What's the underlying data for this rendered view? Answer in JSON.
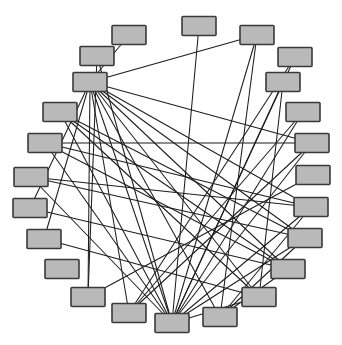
{
  "figure": {
    "type": "node-link-graph",
    "layout": "circular",
    "title": "",
    "caption": "",
    "background_color": "#ffffff"
  },
  "style": {
    "node_fill": "#b9b9b9",
    "node_stroke": "#3a3a3a",
    "node_stroke_width": 1.6,
    "edge_stroke": "#1d1d1d",
    "edge_stroke_width": 1.05,
    "node_width": 34,
    "node_height": 19,
    "node_corner_radius": 1
  },
  "chart_data": {
    "type": "diagram",
    "subtype": "circular-node-link-graph",
    "title": "",
    "xlabel": "",
    "ylabel": "",
    "grid": false,
    "legend": false,
    "node_count": 24,
    "edge_count": 46,
    "nodes": [
      {
        "id": 0,
        "label": "",
        "cx": 199,
        "cy": 26
      },
      {
        "id": 1,
        "label": "",
        "cx": 257,
        "cy": 35
      },
      {
        "id": 2,
        "label": "",
        "cx": 295,
        "cy": 57
      },
      {
        "id": 3,
        "label": "",
        "cx": 283,
        "cy": 82
      },
      {
        "id": 4,
        "label": "",
        "cx": 303,
        "cy": 112
      },
      {
        "id": 5,
        "label": "",
        "cx": 312,
        "cy": 143
      },
      {
        "id": 6,
        "label": "",
        "cx": 313,
        "cy": 175
      },
      {
        "id": 7,
        "label": "",
        "cx": 311,
        "cy": 207
      },
      {
        "id": 8,
        "label": "",
        "cx": 305,
        "cy": 238
      },
      {
        "id": 9,
        "label": "",
        "cx": 288,
        "cy": 269
      },
      {
        "id": 10,
        "label": "",
        "cx": 259,
        "cy": 297
      },
      {
        "id": 11,
        "label": "",
        "cx": 220,
        "cy": 317
      },
      {
        "id": 12,
        "label": "",
        "cx": 172,
        "cy": 323
      },
      {
        "id": 13,
        "label": "",
        "cx": 129,
        "cy": 313
      },
      {
        "id": 14,
        "label": "",
        "cx": 88,
        "cy": 297
      },
      {
        "id": 15,
        "label": "",
        "cx": 62,
        "cy": 269
      },
      {
        "id": 16,
        "label": "",
        "cx": 44,
        "cy": 239
      },
      {
        "id": 17,
        "label": "",
        "cx": 30,
        "cy": 208
      },
      {
        "id": 18,
        "label": "",
        "cx": 31,
        "cy": 177
      },
      {
        "id": 19,
        "label": "",
        "cx": 45,
        "cy": 143
      },
      {
        "id": 20,
        "label": "",
        "cx": 60,
        "cy": 112
      },
      {
        "id": 21,
        "label": "",
        "cx": 90,
        "cy": 82
      },
      {
        "id": 22,
        "label": "",
        "cx": 97,
        "cy": 56
      },
      {
        "id": 23,
        "label": "",
        "cx": 129,
        "cy": 35
      }
    ],
    "edges": [
      {
        "source": 21,
        "target": 1
      },
      {
        "source": 21,
        "target": 23
      },
      {
        "source": 21,
        "target": 12
      },
      {
        "source": 21,
        "target": 13
      },
      {
        "source": 21,
        "target": 14
      },
      {
        "source": 21,
        "target": 11
      },
      {
        "source": 21,
        "target": 10
      },
      {
        "source": 21,
        "target": 9
      },
      {
        "source": 21,
        "target": 8
      },
      {
        "source": 21,
        "target": 7
      },
      {
        "source": 21,
        "target": 5
      },
      {
        "source": 21,
        "target": 16
      },
      {
        "source": 21,
        "target": 17
      },
      {
        "source": 12,
        "target": 0
      },
      {
        "source": 12,
        "target": 1
      },
      {
        "source": 12,
        "target": 2
      },
      {
        "source": 12,
        "target": 3
      },
      {
        "source": 12,
        "target": 4
      },
      {
        "source": 12,
        "target": 5
      },
      {
        "source": 12,
        "target": 7
      },
      {
        "source": 12,
        "target": 8
      },
      {
        "source": 12,
        "target": 10
      },
      {
        "source": 12,
        "target": 20
      },
      {
        "source": 12,
        "target": 19
      },
      {
        "source": 12,
        "target": 18
      },
      {
        "source": 12,
        "target": 22
      },
      {
        "source": 1,
        "target": 11
      },
      {
        "source": 20,
        "target": 8
      },
      {
        "source": 20,
        "target": 9
      },
      {
        "source": 19,
        "target": 5
      },
      {
        "source": 19,
        "target": 7
      },
      {
        "source": 18,
        "target": 7
      },
      {
        "source": 18,
        "target": 8
      },
      {
        "source": 17,
        "target": 9
      },
      {
        "source": 16,
        "target": 10
      },
      {
        "source": 22,
        "target": 14
      },
      {
        "source": 2,
        "target": 13
      },
      {
        "source": 3,
        "target": 10
      },
      {
        "source": 4,
        "target": 13
      },
      {
        "source": 5,
        "target": 13
      },
      {
        "source": 6,
        "target": 14
      },
      {
        "source": 8,
        "target": 11
      },
      {
        "source": 7,
        "target": 11
      },
      {
        "source": 9,
        "target": 11
      },
      {
        "source": 20,
        "target": 10
      },
      {
        "source": 19,
        "target": 9
      }
    ],
    "hub_nodes": [
      21,
      12
    ]
  }
}
